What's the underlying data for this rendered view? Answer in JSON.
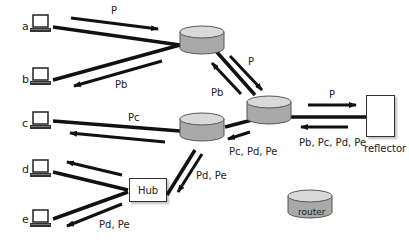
{
  "hosts": [
    {
      "id": "a",
      "label": "a"
    },
    {
      "id": "b",
      "label": "b"
    },
    {
      "id": "c",
      "label": "c"
    },
    {
      "id": "d",
      "label": "d"
    },
    {
      "id": "e",
      "label": "e"
    }
  ],
  "nodes": {
    "hub": "Hub",
    "reflector": "reflector",
    "legend_router": "router"
  },
  "flows": {
    "a_to_r1": "P",
    "r1_to_b": "Pb",
    "r1_to_r2": "P",
    "r2_to_r1": "Pb",
    "r2_to_reflector": "P",
    "reflector_to_r2": "Pb, Pc, Pd, Pe",
    "r2_to_r3": "Pc, Pd, Pe",
    "r3_to_c": "Pc",
    "r3_to_hub": "Pd, Pe",
    "hub_to_e": "Pd, Pe"
  },
  "colors": {
    "router_fill": "#a9a9a9",
    "router_top": "#d9d9d9",
    "line": "#111111"
  }
}
